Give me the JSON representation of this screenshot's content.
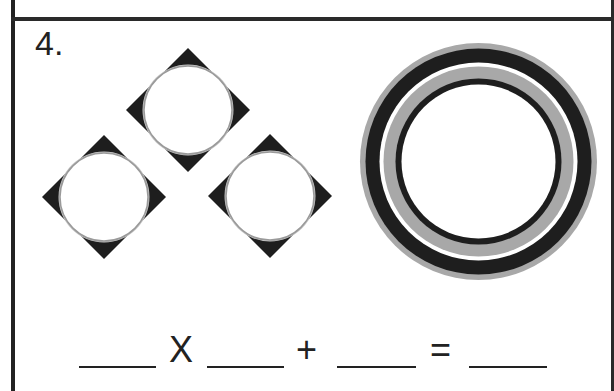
{
  "worksheet": {
    "problem_number": "4.",
    "figures": {
      "diamond_tiles": {
        "count": 3,
        "description": "black diamond with white circle inset",
        "fill_color": "#1e1e1e",
        "circle_outline_color": "#9a9a9a",
        "tiles": [
          {
            "cx": 188,
            "cy": 110,
            "half_diagonal": 62,
            "circle_r": 44
          },
          {
            "cx": 104,
            "cy": 197,
            "half_diagonal": 62,
            "circle_r": 44
          },
          {
            "cx": 270,
            "cy": 196,
            "half_diagonal": 62,
            "circle_r": 44
          }
        ]
      },
      "concentric_ring": {
        "cx": 478.5,
        "cy": 161.5,
        "bands": [
          {
            "r": 118.5,
            "color": "#a8a8a8"
          },
          {
            "r": 113,
            "color": "#1e1e1e"
          },
          {
            "r": 99,
            "color": "#ffffff"
          },
          {
            "r": 95,
            "color": "#a8a8a8"
          },
          {
            "r": 83,
            "color": "#1e1e1e"
          },
          {
            "r": 77,
            "color": "#ffffff"
          }
        ]
      }
    },
    "equation": {
      "blanks": [
        "",
        "",
        "",
        ""
      ],
      "operators": {
        "times": "X",
        "plus": "+",
        "equals": "="
      }
    }
  }
}
